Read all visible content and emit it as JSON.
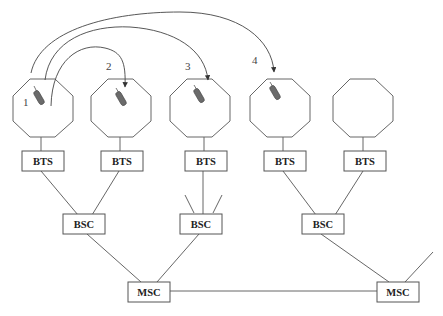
{
  "diagram": {
    "type": "cellular-handoff-network",
    "cells": [
      {
        "id": 1,
        "label": "1",
        "has_phone": true
      },
      {
        "id": 2,
        "label": "2",
        "has_phone": true
      },
      {
        "id": 3,
        "label": "3",
        "has_phone": true
      },
      {
        "id": 4,
        "label": "4",
        "has_phone": true
      },
      {
        "id": 5,
        "label": "",
        "has_phone": false
      }
    ],
    "bts": [
      {
        "label": "BTS"
      },
      {
        "label": "BTS"
      },
      {
        "label": "BTS"
      },
      {
        "label": "BTS"
      },
      {
        "label": "BTS"
      }
    ],
    "bsc": [
      {
        "label": "BSC"
      },
      {
        "label": "BSC"
      },
      {
        "label": "BSC"
      }
    ],
    "msc": [
      {
        "label": "MSC"
      },
      {
        "label": "MSC"
      }
    ],
    "handoff_arcs": [
      {
        "from": "1",
        "to": "2"
      },
      {
        "from": "1",
        "to": "3"
      },
      {
        "from": "1",
        "to": "4"
      }
    ],
    "colors": {
      "stroke": "#555555",
      "phone_fill": "#6b6b6b",
      "background": "#ffffff"
    }
  }
}
